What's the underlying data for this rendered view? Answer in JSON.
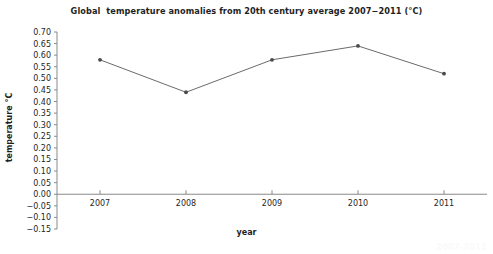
{
  "chart_data": {
    "type": "line",
    "title": "Global  temperature anomalies from 20th century average 2007−2011 (°C)",
    "xlabel": "year",
    "ylabel": "temperature °C",
    "categories": [
      "2007",
      "2008",
      "2009",
      "2010",
      "2011"
    ],
    "x": [
      2007,
      2008,
      2009,
      2010,
      2011
    ],
    "values": [
      0.58,
      0.44,
      0.58,
      0.64,
      0.52
    ],
    "series": [
      {
        "name": "Global temperature anomaly",
        "values": [
          0.58,
          0.44,
          0.58,
          0.64,
          0.52
        ]
      }
    ],
    "ylim": [
      -0.15,
      0.7
    ],
    "ytick_labels": [
      "0.70",
      "0.65",
      "0.60",
      "0.55",
      "0.50",
      "0.45",
      "0.40",
      "0.35",
      "0.30",
      "0.25",
      "0.20",
      "0.15",
      "0.10",
      "0.05",
      "0.00",
      "−0.05",
      "−0.10",
      "−0.15"
    ],
    "ytick_values": [
      0.7,
      0.65,
      0.6,
      0.55,
      0.5,
      0.45,
      0.4,
      0.35,
      0.3,
      0.25,
      0.2,
      0.15,
      0.1,
      0.05,
      0.0,
      -0.05,
      -0.1,
      -0.15
    ],
    "ytick_step": 0.05,
    "xtick_labels": [
      "2007",
      "2008",
      "2009",
      "2010",
      "2011"
    ],
    "grid": false,
    "legend": "none",
    "zero_line": 0.0,
    "line_color": "#6b6b6b",
    "marker_color": "#4a4a4a",
    "axis_color": "#8a8a8a",
    "text_color": "#1f1f1f",
    "background_color": "#ffffff",
    "marker_style": "dot",
    "line_width_px": 1
  },
  "watermark": {
    "text": "2007‑2011"
  }
}
